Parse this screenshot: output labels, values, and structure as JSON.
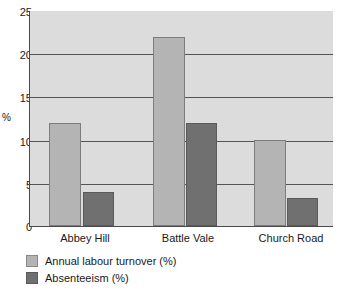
{
  "chart_data": {
    "type": "bar",
    "title": "",
    "subtitle": "",
    "xlabel": "",
    "ylabel": "%",
    "categories": [
      "Abbey Hill",
      "Battle Vale",
      "Church Road"
    ],
    "series": [
      {
        "name": "Annual labour turnover (%)",
        "values": [
          12,
          22,
          10
        ],
        "color": "#b4b4b4"
      },
      {
        "name": "Absenteeism (%)",
        "values": [
          4,
          12,
          3.3
        ],
        "color": "#707070"
      }
    ],
    "ylim": [
      0,
      25
    ],
    "yticks": [
      0,
      5,
      10,
      15,
      20,
      25
    ],
    "ytick_labels": [
      "0",
      "5",
      "10",
      "15",
      "20",
      "25"
    ],
    "grid": true,
    "grid_axis": "y",
    "legend_position": "bottom-left",
    "plot_background": "#dcdcdc",
    "axis_color": "#4a4a4a"
  }
}
